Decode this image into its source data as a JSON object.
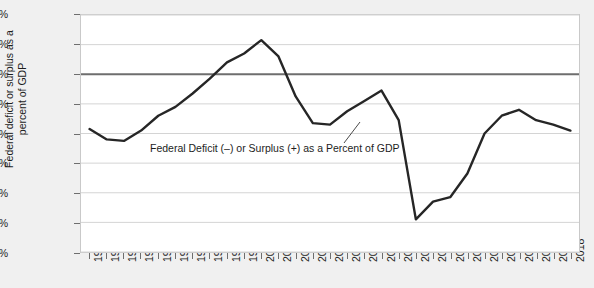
{
  "chart_data": {
    "type": "line",
    "title": "",
    "xlabel": "",
    "ylabel": "Federal deficit or surplus as a\npercent of GDP",
    "annotation": "Federal Deficit (–) or Surplus (+) as a Percent of GDP",
    "legend_position": "none",
    "grid": true,
    "xlim": [
      1990,
      2018
    ],
    "ylim": [
      -12,
      4
    ],
    "ytick_labels": [
      "4%",
      "2%",
      "0%",
      "-2%",
      "-4%",
      "-6%",
      "-8%",
      "-10%",
      "-12%"
    ],
    "ytick_values": [
      4,
      2,
      0,
      -2,
      -4,
      -6,
      -8,
      -10,
      -12
    ],
    "categories": [
      "1990",
      "1991",
      "1992",
      "1993",
      "1994",
      "1995",
      "1996",
      "1997",
      "1998",
      "1999",
      "2000",
      "2001",
      "2002",
      "2003",
      "2004",
      "2005",
      "2006",
      "2007",
      "2008",
      "2009",
      "2010",
      "2011",
      "2012",
      "2013",
      "2014",
      "2015",
      "2016",
      "2017",
      "2018"
    ],
    "series": [
      {
        "name": "Federal Deficit (–) or Surplus (+) as a Percent of GDP",
        "color": "#262626",
        "values": [
          -3.7,
          -4.4,
          -4.5,
          -3.8,
          -2.8,
          -2.2,
          -1.3,
          -0.3,
          0.8,
          1.4,
          2.3,
          1.2,
          -1.5,
          -3.3,
          -3.4,
          -2.5,
          -1.8,
          -1.1,
          -3.1,
          -9.8,
          -8.6,
          -8.3,
          -6.7,
          -4.0,
          -2.8,
          -2.4,
          -3.1,
          -3.4,
          -3.8
        ]
      }
    ]
  }
}
